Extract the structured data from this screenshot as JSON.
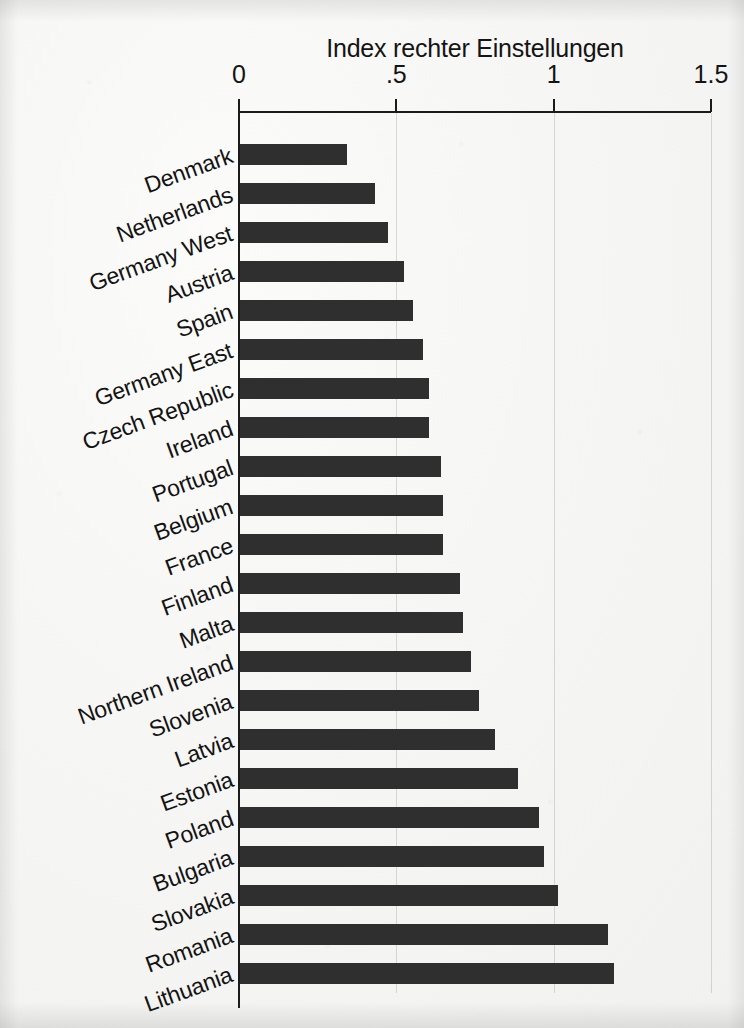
{
  "chart_data": {
    "type": "bar",
    "orientation": "horizontal",
    "title": "Index rechter Einstellungen",
    "xlabel": "",
    "ylabel": "",
    "xlim": [
      0,
      1.5
    ],
    "grid": true,
    "legend": null,
    "axis_ticks": [
      "0",
      ".5",
      "1",
      "1.5"
    ],
    "axis_tick_values": [
      0,
      0.5,
      1,
      1.5
    ],
    "categories": [
      "Denmark",
      "Netherlands",
      "Germany West",
      "Austria",
      "Spain",
      "Germany East",
      "Czech Republic",
      "Ireland",
      "Portugal",
      "Belgium",
      "France",
      "Finland",
      "Malta",
      "Northern Ireland",
      "Slovenia",
      "Latvia",
      "Estonia",
      "Poland",
      "Bulgaria",
      "Slovakia",
      "Romania",
      "Lithuania"
    ],
    "values": [
      0.34,
      0.43,
      0.47,
      0.52,
      0.55,
      0.58,
      0.6,
      0.6,
      0.64,
      0.645,
      0.645,
      0.7,
      0.71,
      0.735,
      0.76,
      0.81,
      0.885,
      0.95,
      0.965,
      1.01,
      1.17,
      1.19
    ],
    "bar_color": "#2f2f2f",
    "background_color": "#f5f5f3",
    "axis_color": "#1b1b1b"
  }
}
